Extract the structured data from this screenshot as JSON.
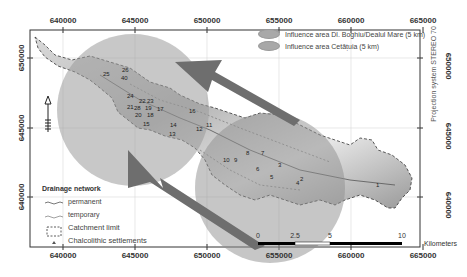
{
  "map": {
    "projection_label": "Projection system STEREO 70",
    "x_ticks": [
      {
        "label": "640000",
        "x": 63
      },
      {
        "label": "645000",
        "x": 135
      },
      {
        "label": "650000",
        "x": 207
      },
      {
        "label": "655000",
        "x": 279
      },
      {
        "label": "660000",
        "x": 351
      },
      {
        "label": "665000",
        "x": 423
      }
    ],
    "y_ticks": [
      {
        "label": "650000",
        "y": 58
      },
      {
        "label": "645000",
        "y": 128
      },
      {
        "label": "640000",
        "y": 197
      }
    ],
    "legend_influence": {
      "items": [
        {
          "label": "Influence area Dl. Boghiu/Dealul Mare (5 km)",
          "color": "#a8a8a8"
        },
        {
          "label": "Influence area Cetățuia (5 km)",
          "color": "#a0a0a0"
        }
      ]
    },
    "legend_network": {
      "title": "Drainage network",
      "items": [
        {
          "label": "permanent"
        },
        {
          "label": "temporary"
        },
        {
          "label": "Catchment limit"
        },
        {
          "label": "Chalcolithic settlements"
        }
      ]
    },
    "scale_bar": {
      "labels": [
        "0",
        "2.5",
        "5",
        "10"
      ],
      "unit": "Kilometers"
    },
    "settlements": [
      {
        "id": "25",
        "x": 103,
        "y": 71
      },
      {
        "id": "26",
        "x": 122,
        "y": 67
      },
      {
        "id": "40",
        "x": 121,
        "y": 75
      },
      {
        "id": "24",
        "x": 127,
        "y": 93
      },
      {
        "id": "22",
        "x": 139,
        "y": 98
      },
      {
        "id": "23",
        "x": 147,
        "y": 98
      },
      {
        "id": "21",
        "x": 127,
        "y": 104
      },
      {
        "id": "28",
        "x": 134,
        "y": 105
      },
      {
        "id": "19",
        "x": 145,
        "y": 105
      },
      {
        "id": "17",
        "x": 157,
        "y": 106
      },
      {
        "id": "20",
        "x": 135,
        "y": 112
      },
      {
        "id": "18",
        "x": 147,
        "y": 112
      },
      {
        "id": "16",
        "x": 189,
        "y": 108
      },
      {
        "id": "15",
        "x": 143,
        "y": 121
      },
      {
        "id": "14",
        "x": 170,
        "y": 122
      },
      {
        "id": "13",
        "x": 169,
        "y": 131
      },
      {
        "id": "12",
        "x": 196,
        "y": 126
      },
      {
        "id": "11",
        "x": 206,
        "y": 122
      },
      {
        "id": "10",
        "x": 223,
        "y": 157
      },
      {
        "id": "9",
        "x": 234,
        "y": 157
      },
      {
        "id": "8",
        "x": 246,
        "y": 150
      },
      {
        "id": "7",
        "x": 261,
        "y": 150
      },
      {
        "id": "6",
        "x": 256,
        "y": 166
      },
      {
        "id": "5",
        "x": 270,
        "y": 174
      },
      {
        "id": "4",
        "x": 296,
        "y": 180
      },
      {
        "id": "3",
        "x": 278,
        "y": 162
      },
      {
        "id": "2",
        "x": 300,
        "y": 176
      },
      {
        "id": "1",
        "x": 376,
        "y": 182
      }
    ]
  }
}
